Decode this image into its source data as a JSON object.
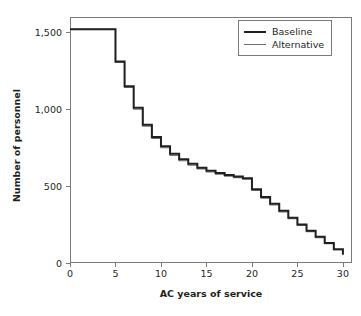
{
  "chart_data": {
    "type": "line",
    "title": "",
    "xlabel": "AC years of service",
    "ylabel": "Number of personnel",
    "xlim": [
      0,
      31
    ],
    "ylim": [
      0,
      1600
    ],
    "xticks": [
      0,
      5,
      10,
      15,
      20,
      25,
      30
    ],
    "xtick_labels": [
      "0",
      "5",
      "10",
      "15",
      "20",
      "25",
      "30"
    ],
    "yticks": [
      0,
      500,
      1000,
      1500
    ],
    "ytick_labels": [
      "0",
      "500",
      "1,000",
      "1,500"
    ],
    "grid": false,
    "drawstyle": "steps-post",
    "legend_position": "top-right",
    "legend": [
      "Baseline",
      "Alternative"
    ],
    "x": [
      0,
      1,
      2,
      3,
      4,
      5,
      6,
      7,
      8,
      9,
      10,
      11,
      12,
      13,
      14,
      15,
      16,
      17,
      18,
      19,
      20,
      21,
      22,
      23,
      24,
      25,
      26,
      27,
      28,
      29,
      30
    ],
    "series": [
      {
        "name": "Baseline",
        "color": "#231f20",
        "values": [
          1520,
          1520,
          1520,
          1520,
          1520,
          1310,
          1150,
          1010,
          900,
          820,
          760,
          710,
          675,
          645,
          620,
          600,
          585,
          572,
          562,
          552,
          480,
          430,
          385,
          340,
          295,
          250,
          210,
          170,
          130,
          90,
          55
        ]
      },
      {
        "name": "Alternative",
        "color": "#6f6f6f",
        "values": [
          1520,
          1520,
          1520,
          1520,
          1520,
          1305,
          1142,
          1000,
          890,
          810,
          750,
          700,
          665,
          636,
          612,
          592,
          578,
          565,
          555,
          545,
          472,
          422,
          377,
          332,
          288,
          244,
          204,
          164,
          125,
          86,
          50
        ]
      }
    ]
  }
}
